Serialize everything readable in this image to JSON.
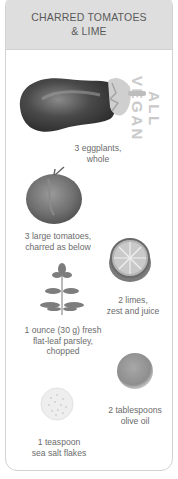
{
  "card": {
    "title_line1": "CHARRED TOMATOES",
    "title_line2": "& LIME",
    "side_tag": "ALL VEGAN",
    "colors": {
      "header_bg": "#dedede",
      "border": "#d2d2d2",
      "side_tag": "#c9c9c9",
      "text": "#6b6b6b"
    }
  },
  "ingredients": [
    {
      "icon": "eggplant-icon",
      "line1": "3 eggplants,",
      "line2": "whole"
    },
    {
      "icon": "tomato-icon",
      "line1": "3 large tomatoes,",
      "line2": "charred as below"
    },
    {
      "icon": "lime-icon",
      "line1": "2 limes,",
      "line2": "zest and juice"
    },
    {
      "icon": "parsley-icon",
      "line1": "1 ounce (30 g) fresh",
      "line2": "flat-leaf parsley,",
      "line3": "chopped"
    },
    {
      "icon": "olive-oil-icon",
      "line1": "2 tablespoons",
      "line2": "olive oil"
    },
    {
      "icon": "sea-salt-icon",
      "line1": "1 teaspoon",
      "line2": "sea salt flakes"
    }
  ]
}
